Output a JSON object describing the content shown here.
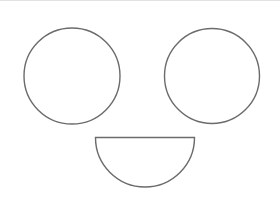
{
  "canvas": {
    "width": 280,
    "height": 208,
    "background_color": "#ffffff",
    "edge_hairline_color": "#e2e2e2",
    "stroke_color": "#6b6b6b",
    "stroke_width": 1.4,
    "shapes": [
      {
        "name": "left-eye-circle",
        "type": "circle",
        "cx": 72,
        "cy": 76,
        "r": 48
      },
      {
        "name": "right-eye-circle",
        "type": "circle",
        "cx": 212,
        "cy": 76,
        "r": 47.5
      },
      {
        "name": "mouth-semicircle",
        "type": "semicircle-down",
        "cx": 145,
        "cy": 137.5,
        "r": 49.5
      }
    ]
  }
}
